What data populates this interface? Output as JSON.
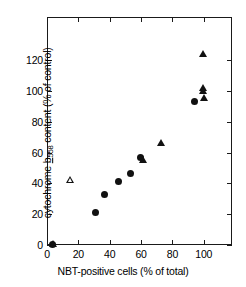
{
  "chart_data": {
    "type": "scatter",
    "title": "",
    "xlabel": "NBT-positive cells (% of total)",
    "ylabel": "cytochrome b558 content (% of control)",
    "ylabel_parts": {
      "prefix": "cytochrome ",
      "italic_symbol": "b",
      "subscript": "558",
      "suffix": " content (% of control)"
    },
    "xlim": [
      0,
      118
    ],
    "ylim": [
      0,
      148
    ],
    "xticks": [
      0,
      20,
      40,
      60,
      80,
      100
    ],
    "yticks": [
      0,
      20,
      40,
      60,
      80,
      100,
      120
    ],
    "grid": false,
    "legend": "none",
    "series": [
      {
        "name": "filled-circle",
        "marker": "circle-filled",
        "points": [
          {
            "x": 3.5,
            "y": 0.5
          },
          {
            "x": 31.0,
            "y": 21.0
          },
          {
            "x": 36.5,
            "y": 33.0
          },
          {
            "x": 45.5,
            "y": 41.0
          },
          {
            "x": 53.0,
            "y": 46.5
          },
          {
            "x": 59.5,
            "y": 57.0
          },
          {
            "x": 94.0,
            "y": 93.0
          }
        ]
      },
      {
        "name": "filled-triangle",
        "marker": "triangle-filled",
        "points": [
          {
            "x": 4.0,
            "y": 0.5
          },
          {
            "x": 61.5,
            "y": 55.0
          },
          {
            "x": 73.0,
            "y": 66.0
          },
          {
            "x": 99.5,
            "y": 124.0
          },
          {
            "x": 99.5,
            "y": 102.0
          },
          {
            "x": 99.5,
            "y": 100.0
          },
          {
            "x": 100.5,
            "y": 95.0
          }
        ]
      },
      {
        "name": "open-triangle",
        "marker": "triangle-open",
        "points": [
          {
            "x": 15.0,
            "y": 42.0
          }
        ]
      }
    ]
  }
}
